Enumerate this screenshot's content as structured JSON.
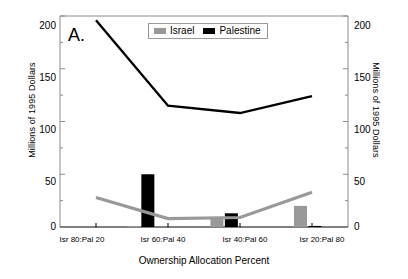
{
  "chart_data": {
    "type": "line",
    "title": "",
    "panel_label": "A.",
    "xlabel": "Ownership Allocation Percent",
    "ylabel": "Millions of 1995 Dollars",
    "ylabel_right": "Millions of 1995 Dollars",
    "categories": [
      "Isr 80:Pal 20",
      "Isr 60:Pal 40",
      "Isr 40:Pal 60",
      "Isr 20:Pal 80"
    ],
    "ylim": [
      0,
      200
    ],
    "yticks": [
      0,
      50,
      100,
      150,
      200
    ],
    "yticks_minor": [
      25,
      75,
      125,
      175
    ],
    "ytick_labels": [
      "0",
      "50",
      "100",
      "150",
      "200"
    ],
    "grid": false,
    "legend_position": "top-center",
    "series": [
      {
        "name": "Israel",
        "kind": "line",
        "color": "#999999",
        "values": [
          28,
          8,
          9,
          33
        ]
      },
      {
        "name": "Palestine",
        "kind": "line",
        "color": "#000000",
        "values": [
          196,
          115,
          108,
          124
        ]
      }
    ],
    "bars": [
      {
        "series": "Israel",
        "color": "#999999",
        "x_frac": 0.255,
        "value": 1
      },
      {
        "series": "Palestine",
        "color": "#000000",
        "x_frac": 0.305,
        "value": 50
      },
      {
        "series": "Israel",
        "color": "#999999",
        "x_frac": 0.545,
        "value": 8
      },
      {
        "series": "Palestine",
        "color": "#000000",
        "x_frac": 0.595,
        "value": 13
      },
      {
        "series": "Israel",
        "color": "#999999",
        "x_frac": 0.835,
        "value": 20
      },
      {
        "series": "Palestine",
        "color": "#000000",
        "x_frac": 0.885,
        "value": 1
      }
    ],
    "colors": {
      "israel": "#999999",
      "palestine": "#000000",
      "frame": "#8a8a8a",
      "axis": "#000000",
      "background": "#ffffff"
    }
  },
  "legend": {
    "items": [
      {
        "label": "Israel",
        "color": "#999999"
      },
      {
        "label": "Palestine",
        "color": "#000000"
      }
    ]
  }
}
